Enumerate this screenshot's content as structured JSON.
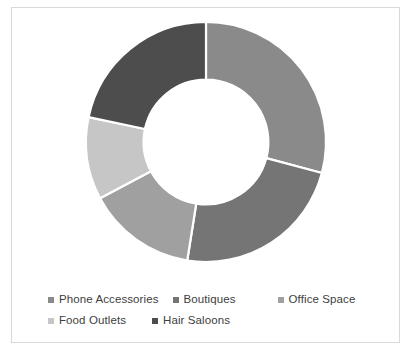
{
  "chart_data": {
    "type": "pie",
    "variant": "doughnut",
    "title": "",
    "xlabel": "",
    "ylabel": "",
    "legend_position": "bottom",
    "grid": false,
    "hole_ratio": 0.52,
    "start_angle_deg": 0,
    "direction": "clockwise",
    "categories": [
      "Phone Accessories",
      "Boutiques",
      "Office Space",
      "Food Outlets",
      "Hair Saloons"
    ],
    "values": [
      29,
      23,
      15,
      11,
      22
    ],
    "value_unit": "%",
    "colors": [
      "#8a8a8a",
      "#757575",
      "#a0a0a0",
      "#c6c6c6",
      "#4d4d4d"
    ],
    "segments": [
      {
        "label": "Phone Accessories",
        "value": 29,
        "color": "#8a8a8a",
        "start_deg": 0,
        "end_deg": 105
      },
      {
        "label": "Boutiques",
        "value": 23,
        "color": "#757575",
        "start_deg": 105,
        "end_deg": 189
      },
      {
        "label": "Office Space",
        "value": 15,
        "color": "#a0a0a0",
        "start_deg": 189,
        "end_deg": 242
      },
      {
        "label": "Food Outlets",
        "value": 11,
        "color": "#c6c6c6",
        "start_deg": 242,
        "end_deg": 282
      },
      {
        "label": "Hair Saloons",
        "value": 22,
        "color": "#4d4d4d",
        "start_deg": 282,
        "end_deg": 360
      }
    ]
  },
  "legend": {
    "rows": [
      [
        {
          "label": "Phone Accessories",
          "color": "#8a8a8a",
          "swatch": "legend-swatch-phone-accessories"
        },
        {
          "label": "Boutiques",
          "color": "#757575",
          "swatch": "legend-swatch-boutiques"
        },
        {
          "label": "Office Space",
          "color": "#a0a0a0",
          "swatch": "legend-swatch-office-space"
        }
      ],
      [
        {
          "label": "Food Outlets",
          "color": "#c6c6c6",
          "swatch": "legend-swatch-food-outlets"
        },
        {
          "label": "Hair Saloons",
          "color": "#4d4d4d",
          "swatch": "legend-swatch-hair-saloons"
        }
      ]
    ]
  },
  "style": {
    "border_color": "#d9d9d9",
    "background": "#ffffff",
    "separator_color": "#ffffff",
    "text_color": "#404040"
  }
}
